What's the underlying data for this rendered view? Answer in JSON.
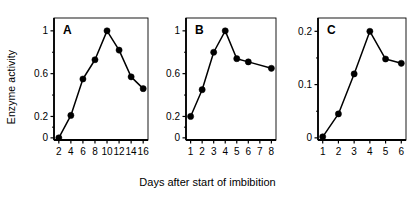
{
  "figure": {
    "ylabel": "Enzyme activity",
    "xlabel": "Days after start of imbibition",
    "marker_color": "#000000",
    "line_color": "#000000",
    "frame_color": "#000000"
  },
  "chart_data": [
    {
      "type": "line",
      "title": "A",
      "panel_label": "A",
      "xlabel": "Days after start of imbibition",
      "ylabel": "Enzyme activity",
      "x": [
        2,
        4,
        6,
        8,
        10,
        12,
        14,
        16
      ],
      "values": [
        0.0,
        0.21,
        0.55,
        0.73,
        1.0,
        0.82,
        0.57,
        0.46
      ],
      "xticks": [
        2,
        4,
        6,
        8,
        10,
        12,
        14,
        16
      ],
      "xticklabels": [
        "2",
        "4",
        "6",
        "8",
        "10",
        "12",
        "14",
        "16"
      ],
      "yticks": [
        0,
        0.2,
        0.6,
        1
      ],
      "yticklabels": [
        "0",
        "0.2",
        "0.6",
        "1"
      ],
      "xlim": [
        1.2,
        16.8
      ],
      "ylim": [
        -0.02,
        1.12
      ],
      "grid": false,
      "legend": "none",
      "marker": "filled-circle"
    },
    {
      "type": "line",
      "title": "B",
      "panel_label": "B",
      "xlabel": "Days after start of imbibition",
      "ylabel": "Enzyme activity",
      "x": [
        1,
        2,
        3,
        4,
        5,
        6,
        8
      ],
      "values": [
        0.2,
        0.45,
        0.8,
        1.0,
        0.74,
        0.71,
        0.65
      ],
      "xticks": [
        1,
        2,
        3,
        4,
        5,
        6,
        7,
        8
      ],
      "xticklabels": [
        "1",
        "2",
        "3",
        "4",
        "5",
        "6",
        "7",
        "8"
      ],
      "yticks": [
        0,
        0.2,
        0.6,
        1
      ],
      "yticklabels": [
        "0",
        "0.2",
        "0.6",
        "1"
      ],
      "xlim": [
        0.6,
        8.4
      ],
      "ylim": [
        -0.02,
        1.12
      ],
      "grid": false,
      "legend": "none",
      "marker": "filled-circle"
    },
    {
      "type": "line",
      "title": "C",
      "panel_label": "C",
      "xlabel": "Days after start of imbibition",
      "ylabel": "Enzyme activity",
      "x": [
        1,
        2,
        3,
        4,
        5,
        6
      ],
      "values": [
        0.002,
        0.045,
        0.12,
        0.2,
        0.148,
        0.14
      ],
      "xticks": [
        1,
        2,
        3,
        4,
        5,
        6
      ],
      "xticklabels": [
        "1",
        "2",
        "3",
        "4",
        "5",
        "6"
      ],
      "yticks": [
        0,
        0.1,
        0.2
      ],
      "yticklabels": [
        "0",
        "0.1",
        "0.2"
      ],
      "xlim": [
        0.7,
        6.3
      ],
      "ylim": [
        -0.004,
        0.225
      ],
      "grid": false,
      "legend": "none",
      "marker": "filled-circle"
    }
  ]
}
